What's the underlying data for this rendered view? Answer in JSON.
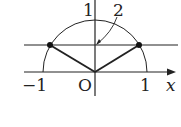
{
  "diagram": {
    "type": "unit-semicircle-plot",
    "labels": {
      "y_tick_top": "1",
      "annotation": "2",
      "x_neg": "−1",
      "origin": "O",
      "x_pos": "1",
      "x_axis": "x"
    },
    "colors": {
      "stroke": "#222222",
      "background": "#ffffff"
    }
  }
}
